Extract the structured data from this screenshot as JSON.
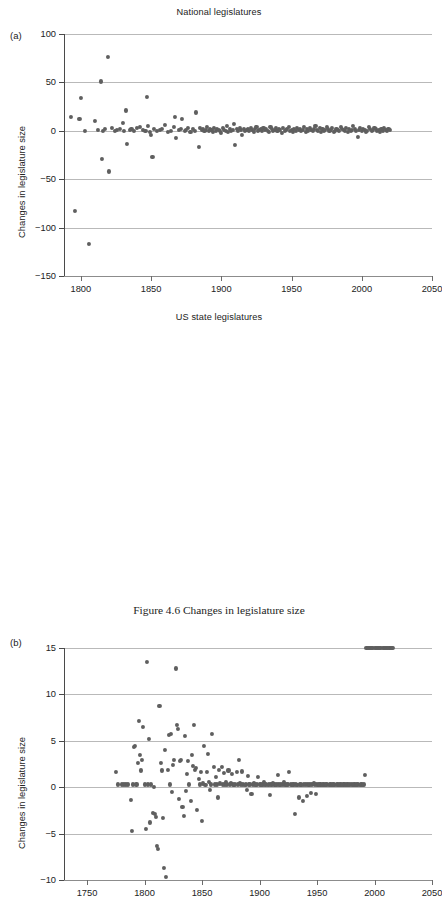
{
  "caption": "Figure 4.6  Changes in legislature size",
  "marker_color": "#5f5f5f",
  "grid_color": "#b9b9b9",
  "panels": {
    "a": {
      "letter": "(a)",
      "title": "National legislatures",
      "ylabel": "Changes in legislature size"
    },
    "b": {
      "letter": "(b)",
      "title": "US state legislatures",
      "ylabel": "Changes in legislature size"
    }
  },
  "chart_data": [
    {
      "panel": "a",
      "type": "scatter",
      "title": "National legislatures",
      "xlabel": "",
      "ylabel": "Changes in legislature size",
      "xlim": [
        1788,
        2050
      ],
      "ylim": [
        -150,
        100
      ],
      "xticks": [
        1800,
        1850,
        1900,
        1950,
        2000,
        2050
      ],
      "yticks": [
        100,
        50,
        0,
        -50,
        -100,
        -150
      ],
      "grid": "horizontal",
      "legend": "none",
      "x": [
        1793,
        1796,
        1799,
        1800,
        1803,
        1806,
        1810,
        1812,
        1814,
        1815,
        1816,
        1817,
        1819,
        1820,
        1822,
        1824,
        1826,
        1828,
        1830,
        1831,
        1832,
        1833,
        1835,
        1836,
        1838,
        1840,
        1842,
        1844,
        1846,
        1847,
        1848,
        1849,
        1850,
        1851,
        1852,
        1854,
        1856,
        1858,
        1860,
        1862,
        1864,
        1866,
        1867,
        1868,
        1870,
        1871,
        1872,
        1874,
        1875,
        1876,
        1878,
        1880,
        1881,
        1882,
        1884,
        1885,
        1886,
        1887,
        1888,
        1889,
        1890,
        1891,
        1892,
        1893,
        1894,
        1895,
        1896,
        1897,
        1898,
        1899,
        1900,
        1901,
        1902,
        1903,
        1904,
        1905,
        1906,
        1907,
        1908,
        1909,
        1910,
        1911,
        1912,
        1913,
        1914,
        1915,
        1916,
        1917,
        1918,
        1919,
        1920,
        1921,
        1922,
        1923,
        1924,
        1925,
        1926,
        1927,
        1928,
        1929,
        1930,
        1931,
        1932,
        1933,
        1934,
        1935,
        1936,
        1937,
        1938,
        1939,
        1940,
        1941,
        1942,
        1943,
        1944,
        1945,
        1946,
        1947,
        1948,
        1949,
        1950,
        1951,
        1952,
        1953,
        1954,
        1955,
        1956,
        1957,
        1958,
        1959,
        1960,
        1961,
        1962,
        1963,
        1964,
        1965,
        1966,
        1967,
        1968,
        1969,
        1970,
        1971,
        1972,
        1973,
        1974,
        1975,
        1976,
        1977,
        1978,
        1979,
        1980,
        1981,
        1982,
        1983,
        1984,
        1985,
        1986,
        1987,
        1988,
        1989,
        1990,
        1991,
        1992,
        1993,
        1994,
        1995,
        1996,
        1997,
        1998,
        1999,
        2000,
        2001,
        2002,
        2003,
        2004,
        2005,
        2006,
        2007,
        2008,
        2009,
        2010,
        2011,
        2012,
        2013,
        2014,
        2015,
        2016,
        2017,
        2018,
        2019,
        2020
      ],
      "y": [
        14,
        -83,
        12,
        34,
        0,
        -117,
        10,
        1,
        51,
        -29,
        0,
        2,
        76,
        -42,
        3,
        0,
        1,
        2,
        8,
        0,
        21,
        -14,
        1,
        2,
        0,
        3,
        4,
        1,
        0,
        35,
        5,
        -1,
        -4,
        -27,
        2,
        0,
        1,
        2,
        6,
        -1,
        0,
        4,
        14,
        -7,
        1,
        2,
        12,
        0,
        1,
        3,
        -1,
        2,
        0,
        19,
        -17,
        3,
        1,
        2,
        0,
        1,
        4,
        0,
        2,
        1,
        -1,
        3,
        0,
        2,
        1,
        0,
        -2,
        3,
        1,
        0,
        5,
        -1,
        2,
        0,
        1,
        7,
        -15,
        2,
        0,
        3,
        1,
        -4,
        2,
        0,
        1,
        2,
        0,
        3,
        1,
        -1,
        2,
        4,
        0,
        1,
        2,
        0,
        3,
        1,
        2,
        0,
        -1,
        4,
        2,
        0,
        1,
        3,
        0,
        2,
        1,
        -2,
        3,
        0,
        1,
        2,
        4,
        0,
        1,
        -1,
        2,
        0,
        3,
        1,
        2,
        0,
        1,
        4,
        -1,
        2,
        0,
        3,
        1,
        0,
        2,
        5,
        1,
        0,
        3,
        -1,
        2,
        0,
        1,
        4,
        2,
        0,
        1,
        3,
        -1,
        0,
        2,
        1,
        0,
        4,
        2,
        1,
        0,
        3,
        -1,
        2,
        0,
        1,
        5,
        2,
        0,
        -6,
        1,
        3,
        0,
        2,
        1,
        -1,
        0,
        4,
        2,
        0,
        1,
        3,
        2,
        0,
        1,
        -1,
        2,
        0,
        3,
        1,
        0,
        2,
        1,
        0,
        3,
        1,
        2,
        0,
        1,
        2,
        0,
        1,
        3,
        0,
        1,
        2,
        0,
        1,
        2,
        0,
        1
      ]
    },
    {
      "panel": "b",
      "type": "scatter",
      "title": "US state legislatures",
      "xlabel": "",
      "ylabel": "Changes in legislature size",
      "xlim": [
        1730,
        2050
      ],
      "ylim": [
        -10,
        15
      ],
      "xticks": [
        1750,
        1800,
        1850,
        1900,
        1950,
        2000,
        2050
      ],
      "yticks": [
        15,
        10,
        5,
        0,
        -5,
        -10
      ],
      "grid": "horizontal",
      "legend": "none",
      "x": [
        1775,
        1777,
        1780,
        1782,
        1784,
        1786,
        1788,
        1789,
        1790,
        1791,
        1792,
        1793,
        1794,
        1795,
        1796,
        1797,
        1798,
        1799,
        1800,
        1801,
        1802,
        1803,
        1804,
        1805,
        1806,
        1807,
        1808,
        1809,
        1810,
        1811,
        1812,
        1813,
        1814,
        1815,
        1816,
        1817,
        1818,
        1819,
        1820,
        1821,
        1822,
        1823,
        1824,
        1825,
        1826,
        1827,
        1828,
        1829,
        1830,
        1831,
        1832,
        1833,
        1834,
        1835,
        1836,
        1837,
        1838,
        1839,
        1840,
        1841,
        1842,
        1843,
        1844,
        1845,
        1846,
        1847,
        1848,
        1849,
        1850,
        1851,
        1852,
        1853,
        1854,
        1855,
        1856,
        1857,
        1858,
        1859,
        1860,
        1861,
        1862,
        1863,
        1864,
        1865,
        1866,
        1867,
        1868,
        1869,
        1870,
        1871,
        1872,
        1873,
        1874,
        1875,
        1876,
        1877,
        1878,
        1879,
        1880,
        1881,
        1882,
        1883,
        1884,
        1885,
        1886,
        1887,
        1888,
        1889,
        1890,
        1891,
        1892,
        1893,
        1894,
        1895,
        1896,
        1897,
        1898,
        1899,
        1900,
        1901,
        1902,
        1903,
        1904,
        1905,
        1906,
        1907,
        1908,
        1909,
        1910,
        1911,
        1912,
        1913,
        1914,
        1915,
        1916,
        1917,
        1918,
        1919,
        1920,
        1921,
        1922,
        1923,
        1924,
        1925,
        1926,
        1927,
        1928,
        1929,
        1930,
        1931,
        1932,
        1933,
        1934,
        1935,
        1936,
        1937,
        1938,
        1939,
        1940,
        1941,
        1942,
        1943,
        1944,
        1945,
        1946,
        1947,
        1948,
        1949,
        1950,
        1951,
        1952,
        1953,
        1954,
        1955,
        1956,
        1957,
        1958,
        1959,
        1960,
        1961,
        1962,
        1963,
        1964,
        1965,
        1966,
        1967,
        1968,
        1969,
        1970,
        1971,
        1972,
        1973,
        1974,
        1975,
        1976,
        1977,
        1978,
        1979,
        1980,
        1981,
        1982,
        1983,
        1984,
        1985,
        1986,
        1987,
        1988,
        1989,
        1990,
        1991,
        1992,
        1993,
        1994,
        1995,
        1996,
        1997,
        1998,
        1999,
        2000,
        2001,
        2002,
        2003,
        2004,
        2005,
        2006,
        2007,
        2008,
        2009,
        2010,
        2011,
        2012,
        2013,
        2014,
        2015,
        2016
      ],
      "y": [
        1.6,
        0.3,
        0.3,
        0.3,
        0.3,
        0.3,
        -1.4,
        -4.7,
        0.3,
        4.3,
        4.4,
        0.3,
        2.6,
        7.1,
        3.5,
        1.8,
        2.9,
        6.5,
        0.3,
        -4.5,
        13.5,
        0.3,
        5.2,
        -3.8,
        0.3,
        -2.8,
        0,
        -2.9,
        -3.2,
        -6.3,
        -6.7,
        8.8,
        2.6,
        1.8,
        -3.3,
        -8.7,
        4,
        -9.7,
        1.9,
        5.6,
        0.3,
        5.7,
        -0.5,
        2.4,
        2.9,
        12.8,
        6.7,
        6.3,
        -1.3,
        2.8,
        2.9,
        -2.1,
        -3.1,
        5.5,
        -0.4,
        1.4,
        2.8,
        0.3,
        -1.5,
        3.5,
        2.3,
        6.7,
        1.9,
        2.1,
        -2.5,
        0.9,
        0.3,
        1.6,
        -3.6,
        0.4,
        4.4,
        0.2,
        1.6,
        3.6,
        0.6,
        -0.3,
        0.3,
        5.7,
        2.2,
        0.3,
        1.1,
        0.3,
        -1.1,
        1.9,
        0.4,
        2.2,
        0.3,
        1.5,
        0.3,
        0.6,
        0.3,
        1.8,
        0.3,
        0.5,
        1.4,
        0.3,
        0.2,
        0.3,
        1.6,
        0.3,
        2.9,
        0.4,
        0.3,
        1.7,
        0.3,
        0.2,
        0.3,
        -0.3,
        1.2,
        0.3,
        0.3,
        -0.7,
        0.3,
        0.4,
        0.3,
        0.2,
        0.3,
        1.1,
        0.3,
        0.3,
        0.2,
        0.3,
        0.6,
        0.3,
        0.3,
        0.2,
        0.3,
        -0.8,
        0.3,
        0.3,
        0.4,
        0.3,
        0.2,
        0.3,
        1.3,
        0.3,
        0.2,
        0.3,
        0.3,
        0.6,
        0.3,
        0.2,
        0.3,
        0.3,
        1.6,
        0.3,
        0.2,
        0.3,
        0.3,
        -2.9,
        0.3,
        0.2,
        -1.1,
        0.3,
        0.3,
        0.2,
        -1.5,
        0.3,
        0.3,
        -0.9,
        0.3,
        0.2,
        0.3,
        -0.6,
        0.3,
        0.4,
        0.3,
        -0.7,
        0.3,
        0.2,
        0.3,
        0.3,
        0.2,
        0.3,
        0.3,
        0.2,
        0.3,
        0.3,
        0.2,
        0.3,
        0.3,
        0.2,
        0.3,
        0.3,
        0.2,
        0.3,
        0.3,
        0.2,
        0.3,
        0.3,
        0.2,
        0.3,
        0.3,
        0.2,
        0.3,
        0.3,
        0.2,
        0.3,
        0.3,
        0.2,
        0.3,
        0.3,
        0.2,
        0.3,
        0.3,
        0.2,
        0.3,
        0.3,
        0.2,
        0.3,
        1.3
      ]
    }
  ]
}
